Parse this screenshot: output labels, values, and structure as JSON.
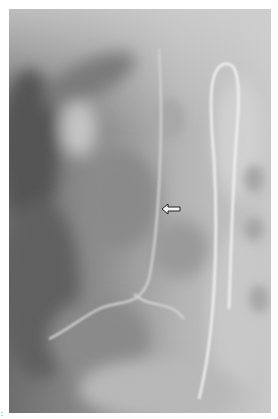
{
  "image": {
    "type": "radiograph",
    "description": "Grayscale X-ray image showing a curved catheter/wire on the right side and an open arrow annotation pointing left",
    "background": "#ffffff",
    "tones": {
      "dark": "#5a5a5a",
      "mid": "#9a9a9a",
      "light": "#d8d8d8",
      "catheter": "#f4f4f4"
    }
  },
  "annotations": {
    "arrow": {
      "shape": "open-arrow-left",
      "label": ""
    },
    "corner_mark": ":"
  }
}
